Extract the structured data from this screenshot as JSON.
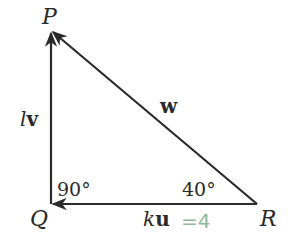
{
  "diagram": {
    "type": "vector-triangle",
    "vertices": {
      "P": {
        "label": "P",
        "x": 51,
        "y": 32
      },
      "Q": {
        "label": "Q",
        "x": 51,
        "y": 204
      },
      "R": {
        "label": "R",
        "x": 257,
        "y": 204
      }
    },
    "edges": [
      {
        "from": "Q",
        "to": "P",
        "label_var": "l",
        "label_vec": "v"
      },
      {
        "from": "R",
        "to": "P",
        "label_var": "",
        "label_vec": "w"
      },
      {
        "from": "R",
        "to": "Q",
        "label_var": "k",
        "label_vec": "u"
      }
    ],
    "angles": {
      "Q": "90°",
      "R": "40°"
    },
    "annotation": {
      "text": "=4",
      "color": "#8fb89a",
      "attached_to": "ku"
    },
    "colors": {
      "line": "#2a2a2a",
      "background": "#ffffff"
    }
  }
}
